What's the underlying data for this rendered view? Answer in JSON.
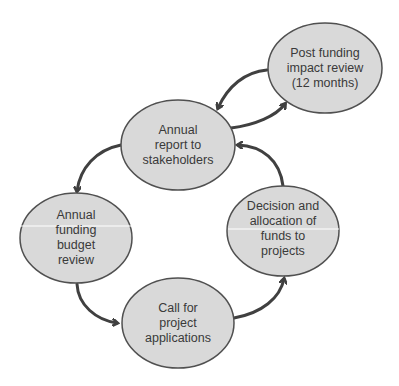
{
  "diagram": {
    "style": {
      "node_fill": "#d9d9d9",
      "node_stroke": "#505050",
      "arrow_color": "#404040",
      "text_color": "#3a3a3a",
      "background": "#ffffff"
    },
    "nodes": [
      {
        "id": "post-funding-impact-review",
        "label": "Post funding\nimpact review\n(12 months)",
        "cx": 325,
        "cy": 68,
        "rx": 57,
        "ry": 45
      },
      {
        "id": "annual-report",
        "label": "Annual\nreport to\nstakeholders",
        "cx": 178,
        "cy": 145,
        "rx": 57,
        "ry": 45
      },
      {
        "id": "annual-funding-budget-review",
        "label": "Annual\nfunding\nbudget\nreview",
        "cx": 76,
        "cy": 238,
        "rx": 56,
        "ry": 45
      },
      {
        "id": "decision-allocation",
        "label": "Decision and\nallocation of\nfunds to\nprojects",
        "cx": 283,
        "cy": 231,
        "rx": 56,
        "ry": 45
      },
      {
        "id": "call-for-applications",
        "label": "Call for\nproject\napplications",
        "cx": 178,
        "cy": 323,
        "rx": 56,
        "ry": 45
      }
    ],
    "edges": [
      {
        "from": "post-funding-impact-review",
        "to": "annual-report",
        "label": ""
      },
      {
        "from": "annual-report",
        "to": "post-funding-impact-review",
        "label": ""
      },
      {
        "from": "decision-allocation",
        "to": "annual-report",
        "label": ""
      },
      {
        "from": "annual-report",
        "to": "annual-funding-budget-review",
        "label": ""
      },
      {
        "from": "annual-funding-budget-review",
        "to": "call-for-applications",
        "label": ""
      },
      {
        "from": "call-for-applications",
        "to": "decision-allocation",
        "label": ""
      }
    ]
  }
}
